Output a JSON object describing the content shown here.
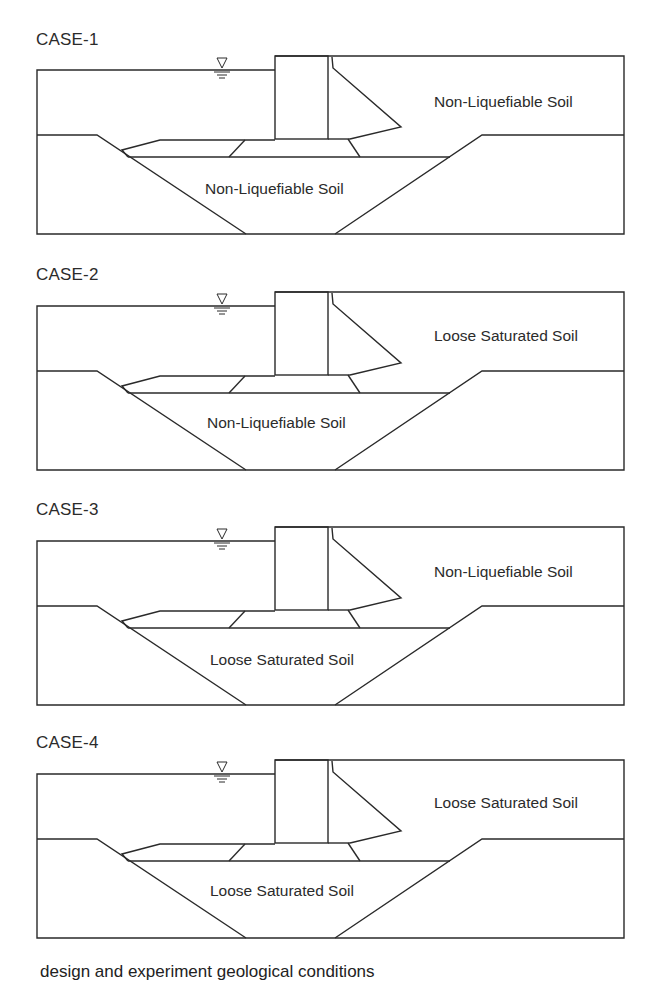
{
  "figure": {
    "caption": "design and experiment geological conditions",
    "line_color": "#2a2a2a",
    "cases": [
      {
        "title": "CASE-1",
        "upper_soil": "Non-Liquefiable Soil",
        "lower_soil": "Non-Liquefiable Soil"
      },
      {
        "title": "CASE-2",
        "upper_soil": "Loose Saturated Soil",
        "lower_soil": "Non-Liquefiable Soil"
      },
      {
        "title": "CASE-3",
        "upper_soil": "Non-Liquefiable Soil",
        "lower_soil": "Loose Saturated Soil"
      },
      {
        "title": "CASE-4",
        "upper_soil": "Loose Saturated Soil",
        "lower_soil": "Loose Saturated Soil"
      }
    ],
    "symbols": {
      "water_level": "water-level-triangle"
    }
  }
}
